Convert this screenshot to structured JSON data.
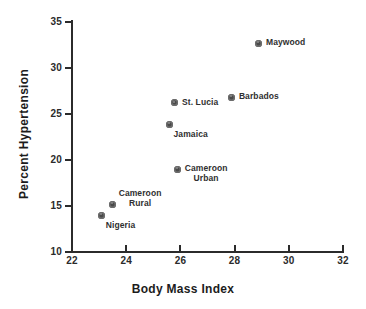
{
  "chart_data": {
    "type": "scatter",
    "title": "",
    "xlabel": "Body Mass Index",
    "ylabel": "Percent Hypertension",
    "xlim": [
      22,
      32
    ],
    "ylim": [
      10,
      35
    ],
    "xticks": [
      22,
      24,
      26,
      28,
      30,
      32
    ],
    "yticks": [
      10,
      15,
      20,
      25,
      30,
      35
    ],
    "grid": false,
    "legend": "none",
    "point_labels_inline": true,
    "points": [
      {
        "label": "Maywood",
        "x": 28.9,
        "y": 32.7,
        "label_lines": [
          "Maywood"
        ],
        "label_pos": "right"
      },
      {
        "label": "Barbados",
        "x": 27.9,
        "y": 26.8,
        "label_lines": [
          "Barbados"
        ],
        "label_pos": "right"
      },
      {
        "label": "St. Lucia",
        "x": 25.8,
        "y": 26.2,
        "label_lines": [
          "St. Lucia"
        ],
        "label_pos": "right"
      },
      {
        "label": "Jamaica",
        "x": 25.6,
        "y": 23.9,
        "label_lines": [
          "Jamaica"
        ],
        "label_pos": "below-right"
      },
      {
        "label": "Cameroon Urban",
        "x": 25.9,
        "y": 19.0,
        "label_lines": [
          "Cameroon",
          "Urban"
        ],
        "label_pos": "right-two-line"
      },
      {
        "label": "Cameroon Rural",
        "x": 23.5,
        "y": 15.2,
        "label_lines": [
          "Cameroon",
          "Rural"
        ],
        "label_pos": "above-right-two-line"
      },
      {
        "label": "Nigeria",
        "x": 23.1,
        "y": 14.0,
        "label_lines": [
          "Nigeria"
        ],
        "label_pos": "below-right"
      }
    ]
  },
  "axes": {
    "x_title": "Body Mass Index",
    "y_title": "Percent Hypertension",
    "x_tick_labels": [
      "22",
      "24",
      "26",
      "28",
      "30",
      "32"
    ],
    "y_tick_labels": [
      "10",
      "15",
      "20",
      "25",
      "30",
      "35"
    ]
  },
  "colors": {
    "marker_fill": "#4a4a4a",
    "marker_ring": "#6e6e6e",
    "axis": "#2b2b2b",
    "text": "#1c1c1c",
    "background": "#ffffff"
  }
}
